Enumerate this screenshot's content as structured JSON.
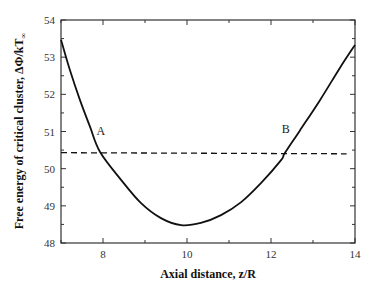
{
  "chart_data": {
    "type": "line",
    "title": "",
    "xlabel": "Axial distance, z/R",
    "ylabel": "Free energy of critical cluster, ΔΦ/kT",
    "ylabel_subscript": "∞",
    "xlim": [
      7,
      14
    ],
    "ylim": [
      48,
      54
    ],
    "xticks": [
      8,
      10,
      12,
      14
    ],
    "xticks_minor": [
      7,
      8,
      9,
      10,
      11,
      12,
      13,
      14
    ],
    "yticks": [
      48,
      49,
      50,
      51,
      52,
      53,
      54
    ],
    "yticks_minor_step": 0.5,
    "grid": false,
    "legend": null,
    "series": [
      {
        "name": "free energy curve",
        "style": "solid",
        "x": [
          7.0,
          7.21,
          7.45,
          7.69,
          7.93,
          8.43,
          8.9,
          9.38,
          9.86,
          10.33,
          10.81,
          11.29,
          11.76,
          12.24,
          12.33,
          12.69,
          13.17,
          13.64,
          14.0
        ],
        "y": [
          53.47,
          52.66,
          51.85,
          51.13,
          50.45,
          49.7,
          49.08,
          48.67,
          48.48,
          48.54,
          48.75,
          49.1,
          49.61,
          50.23,
          50.42,
          51.03,
          51.85,
          52.71,
          53.33
        ]
      },
      {
        "name": "threshold",
        "style": "dashed",
        "x": [
          7.0,
          13.8
        ],
        "y": [
          50.43,
          50.4
        ]
      }
    ],
    "annotations": [
      {
        "text": "A",
        "x": 7.95,
        "y": 50.9
      },
      {
        "text": "B",
        "x": 12.35,
        "y": 50.95
      }
    ]
  }
}
